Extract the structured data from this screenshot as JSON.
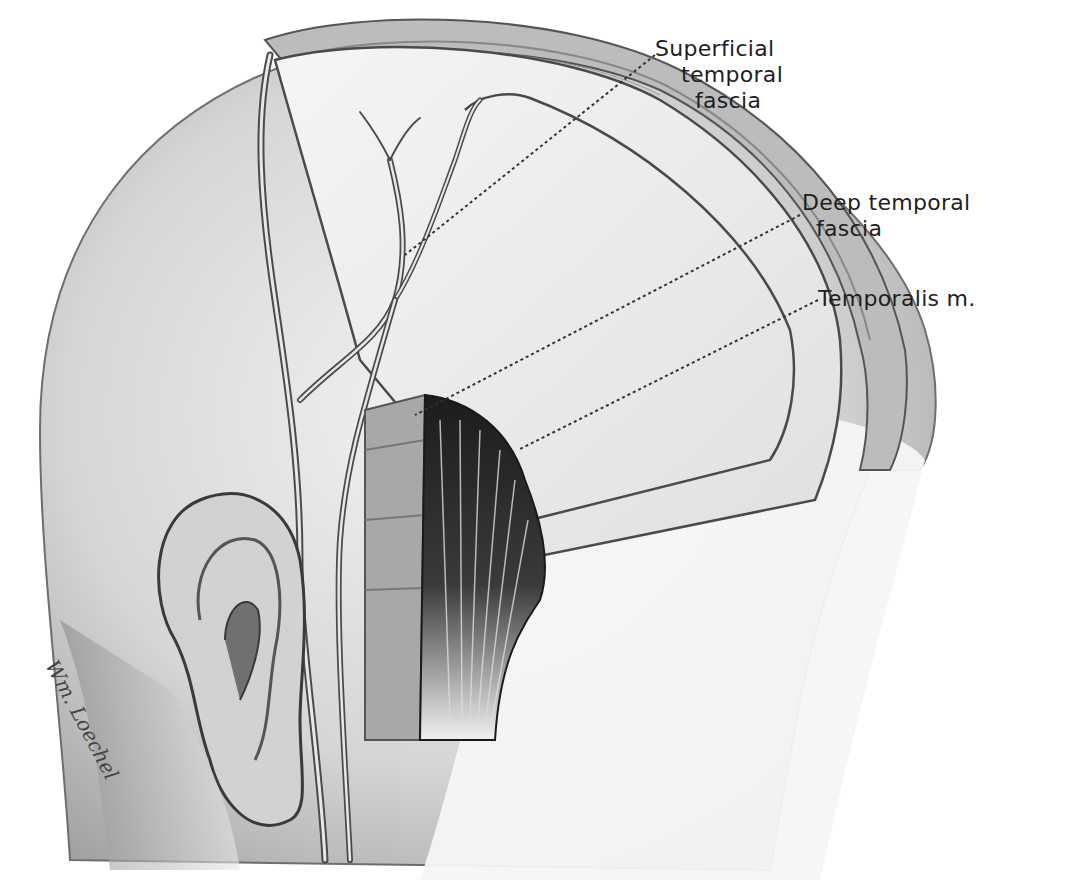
{
  "figure": {
    "type": "anatomical illustration",
    "labels": [
      {
        "id": "superficial",
        "lines": [
          "Superficial",
          "temporal",
          "fascia"
        ]
      },
      {
        "id": "deep",
        "lines": [
          "Deep temporal",
          "fascia"
        ]
      },
      {
        "id": "temporalis",
        "lines": [
          "Temporalis m."
        ]
      }
    ],
    "signature": "Wm. Loechel"
  },
  "colors": {
    "background": "#ffffff",
    "skin": "#d9d9d9",
    "line": "#3a3a3a",
    "muscle": "#2a2a2a",
    "leader": "#333333"
  }
}
